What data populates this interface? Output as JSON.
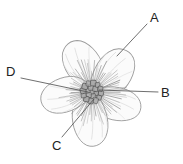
{
  "figure": {
    "kind": "botanical-diagram",
    "background_color": "#ffffff",
    "width": 183,
    "height": 164
  },
  "labels": [
    {
      "id": "A",
      "text": "A",
      "name": "label-a",
      "target": "upper-right-petal",
      "leader_line": {
        "x1": 147,
        "y1": 24,
        "x2": 117,
        "y2": 56
      }
    },
    {
      "id": "B",
      "text": "B",
      "name": "label-b",
      "target": "stamen-filaments-right",
      "leader_line": {
        "x1": 158,
        "y1": 92,
        "x2": 99,
        "y2": 90
      }
    },
    {
      "id": "C",
      "text": "C",
      "name": "label-c",
      "target": "carpel-cluster-lower",
      "leader_line": {
        "x1": 62,
        "y1": 137,
        "x2": 94,
        "y2": 99
      }
    },
    {
      "id": "D",
      "text": "D",
      "name": "label-d",
      "target": "stamen-filaments-left",
      "leader_line": {
        "x1": 21,
        "y1": 78,
        "x2": 88,
        "y2": 92
      }
    }
  ],
  "colors": {
    "leader_line": "#555555",
    "petal_outline": "#9a9a9a",
    "petal_fill": "#fbfbfb",
    "petal_vein": "#c9c9c9",
    "stamen": "#8a8a8a",
    "carpel_fill": "#a9a9a9",
    "carpel_outline": "#4a4a4a",
    "label_text": "#222222"
  },
  "flower": {
    "center": {
      "x": 92,
      "y": 92
    },
    "petal_count": 5,
    "carpel_cell_count": 19,
    "stamen_count": 72,
    "petals": [
      {
        "name": "petal-upper-left",
        "angle": -118
      },
      {
        "name": "petal-upper-right",
        "angle": -52
      },
      {
        "name": "petal-right",
        "angle": 16
      },
      {
        "name": "petal-bottom",
        "angle": 84
      },
      {
        "name": "petal-left",
        "angle": 164
      }
    ]
  }
}
